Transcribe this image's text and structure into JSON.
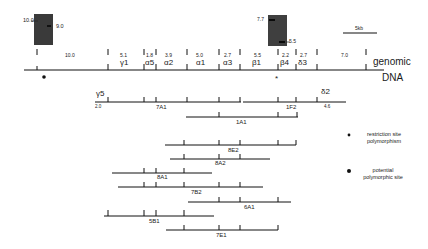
{
  "gels": [
    {
      "bands": [
        "10.0",
        "9.0"
      ]
    },
    {
      "bands": [
        "7.7",
        "5.5"
      ]
    }
  ],
  "scale_bar": {
    "label": "5kb"
  },
  "genomic": {
    "label_line1": "genomic",
    "label_line2": "DNA",
    "fragment_sizes": [
      "10.0",
      "5.1",
      "1.8",
      "3.9",
      "5.0",
      "2.7",
      "5.5",
      "2.2",
      "2.7",
      "7.0"
    ],
    "genes": [
      "γ1",
      "α5",
      "α2",
      "α1",
      "α3",
      "β1",
      "β4",
      "δ3"
    ]
  },
  "clones": [
    {
      "name": "7A1",
      "left_gene": "γ5",
      "left_size": "2.0"
    },
    {
      "name": "1F2",
      "right_gene": "δ2",
      "right_size": "4.6"
    },
    {
      "name": "1A1"
    },
    {
      "name": "8E2"
    },
    {
      "name": "8A2"
    },
    {
      "name": "8A1"
    },
    {
      "name": "7B2"
    },
    {
      "name": "6A1"
    },
    {
      "name": "5B1"
    },
    {
      "name": "7E1"
    }
  ],
  "legend": {
    "item1_line1": "restriction site",
    "item1_line2": "polymorphism",
    "item2_line1": "potential",
    "item2_line2": "polymorphic site",
    "symbol1": "*",
    "symbol2": "●"
  }
}
